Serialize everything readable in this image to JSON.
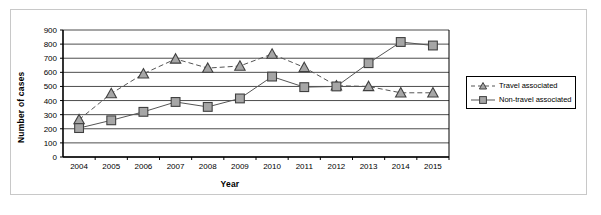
{
  "chart_data": {
    "type": "line",
    "title": "",
    "xlabel": "Year",
    "ylabel": "Number of cases",
    "categories": [
      "2004",
      "2005",
      "2006",
      "2007",
      "2008",
      "2009",
      "2010",
      "2011",
      "2012",
      "2013",
      "2014",
      "2015"
    ],
    "x": [
      2004,
      2005,
      2006,
      2007,
      2008,
      2009,
      2010,
      2011,
      2012,
      2013,
      2014,
      2015
    ],
    "ylim": [
      0,
      900
    ],
    "ytick_step": 100,
    "yticks": [
      "0",
      "100",
      "200",
      "300",
      "400",
      "500",
      "600",
      "700",
      "800",
      "900"
    ],
    "grid": true,
    "legend_position": "right",
    "series": [
      {
        "name": "Travel associated",
        "marker": "triangle",
        "line_style": "dashed",
        "color": "#808080",
        "values": [
          265,
          450,
          590,
          695,
          630,
          645,
          730,
          635,
          505,
          500,
          455,
          455
        ]
      },
      {
        "name": "Non-travel associated",
        "marker": "square",
        "line_style": "solid",
        "color": "#808080",
        "values": [
          205,
          260,
          320,
          390,
          355,
          415,
          570,
          495,
          500,
          665,
          815,
          790
        ]
      }
    ]
  },
  "legend": {
    "items": [
      {
        "label": "Travel associated",
        "icon": "dashed-line-triangle-marker"
      },
      {
        "label": "Non-travel associated",
        "icon": "solid-line-square-marker"
      }
    ]
  },
  "axes": {
    "x_title": "Year",
    "y_title": "Number of cases"
  },
  "colors": {
    "marker_fill": "#a6a6a6",
    "marker_stroke": "#404040",
    "line": "#555555",
    "grid": "#4d4d4d",
    "axis": "#000000",
    "frame": "#c8c8c8",
    "background": "#ffffff"
  }
}
